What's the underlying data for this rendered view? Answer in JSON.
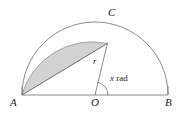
{
  "figure": {
    "background_color": "#ffffff",
    "stroke_color": "#7a7a7a",
    "shade_color": "#d2d2d2",
    "shade_stroke_color": "#8a8a8a",
    "label_color": "#1c1c1c",
    "geometry": {
      "center": {
        "x": 95,
        "y": 95
      },
      "radius": 73,
      "point_a": {
        "x": 22,
        "y": 95
      },
      "point_b": {
        "x": 168,
        "y": 95
      },
      "point_c": {
        "x": 107.4,
        "y": 43.4
      },
      "angle_c_degrees": 135,
      "arc_start_degrees": 0,
      "arc_end_degrees": 180,
      "angle_arc_radius": 13
    },
    "labels": {
      "a": "A",
      "b": "B",
      "c": "C",
      "o": "O",
      "radius": "r",
      "angle_variable": "x",
      "angle_unit": "rad"
    }
  }
}
